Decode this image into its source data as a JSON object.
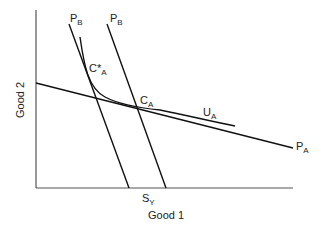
{
  "diagram": {
    "axes": {
      "x_label": "Good 1",
      "y_label": "Good 2",
      "color": "#555555"
    },
    "lines": {
      "PB_left": {
        "label": "P",
        "sub": "B",
        "x1": 69,
        "y1": 24,
        "x2": 129,
        "y2": 188
      },
      "PB_right": {
        "label": "P",
        "sub": "B",
        "x1": 107,
        "y1": 24,
        "x2": 166,
        "y2": 188
      },
      "PA": {
        "label": "P",
        "sub": "A",
        "x1": 36,
        "y1": 83,
        "x2": 293,
        "y2": 148
      },
      "UA": {
        "label": "U",
        "sub": "A"
      }
    },
    "points": {
      "C_star_A": {
        "label": "C*",
        "sub": "A"
      },
      "C_A": {
        "label": "C",
        "sub": "A"
      }
    },
    "axis_point": {
      "label": "S",
      "sub": "Y"
    },
    "stroke_color": "#111111"
  }
}
